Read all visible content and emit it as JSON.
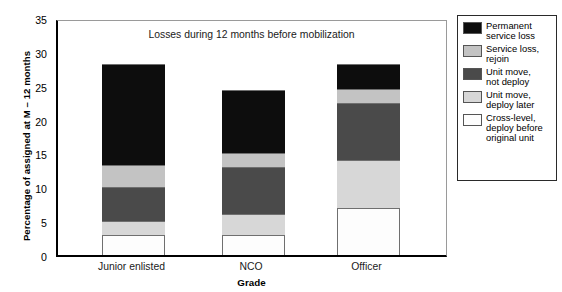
{
  "chart_data": {
    "type": "bar",
    "subtype": "stacked-vertical",
    "title": "Losses during 12 months before mobilization",
    "xlabel": "Grade",
    "ylabel": "Percentage of assigned at M – 12 months",
    "categories": [
      "Junior enlisted",
      "NCO",
      "Officer"
    ],
    "ylim": [
      0,
      35
    ],
    "yticks": [
      "0",
      "5",
      "10",
      "15",
      "20",
      "25",
      "30",
      "35"
    ],
    "ytick_values": [
      0,
      5,
      10,
      15,
      20,
      25,
      30,
      35
    ],
    "grid": false,
    "legend_position": "right-outside",
    "series": [
      {
        "name": "Cross-level, deploy before original unit",
        "color": "#fdfdfd",
        "values": [
          3.0,
          3.0,
          7.0
        ]
      },
      {
        "name": "Unit move, deploy later",
        "color": "#d7d7d7",
        "values": [
          2.0,
          3.0,
          7.0
        ]
      },
      {
        "name": "Unit move, not deploy",
        "color": "#4a4a4a",
        "values": [
          5.0,
          7.0,
          8.5
        ]
      },
      {
        "name": "Service loss, rejoin",
        "color": "#c3c3c3",
        "values": [
          3.3,
          2.0,
          2.0
        ]
      },
      {
        "name": "Permanent service loss",
        "color": "#0d0d0d",
        "values": [
          14.9,
          9.3,
          3.7
        ]
      }
    ],
    "totals": [
      28.2,
      24.3,
      28.2
    ],
    "cumulative_boundaries": {
      "Junior enlisted": [
        0,
        3.0,
        5.0,
        10.0,
        13.3,
        28.2
      ],
      "NCO": [
        0,
        3.0,
        6.0,
        13.0,
        15.0,
        24.3
      ],
      "Officer": [
        0,
        7.0,
        14.0,
        22.5,
        24.5,
        28.2
      ]
    }
  },
  "legend": {
    "items": [
      {
        "label": "Permanent\nservice loss",
        "color": "#0d0d0d"
      },
      {
        "label": "Service loss,\nrejoin",
        "color": "#c3c3c3"
      },
      {
        "label": "Unit move,\nnot deploy",
        "color": "#4a4a4a"
      },
      {
        "label": "Unit move,\ndeploy later",
        "color": "#d7d7d7"
      },
      {
        "label": "Cross-level,\ndeploy before\noriginal unit",
        "color": "#fdfdfd"
      }
    ]
  }
}
